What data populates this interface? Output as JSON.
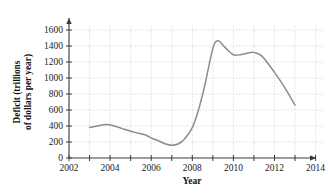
{
  "chart_data": {
    "type": "line",
    "title": "",
    "xlabel": "Year",
    "ylabel": "Deficit (trillions of dollars per year)",
    "ylabel_line1": "Deficit (trillions",
    "ylabel_line2": "of dollars per year)",
    "xlim": [
      2002,
      2014.6
    ],
    "ylim": [
      0,
      1700
    ],
    "grid": true,
    "grid_style": "dotted",
    "legend": "none",
    "line_color": "#8c8c8c",
    "axis_color": "#3a3a3a",
    "grid_color": "#bdbdbd",
    "x_ticks_major": [
      2002,
      2004,
      2006,
      2008,
      2010,
      2012,
      2014
    ],
    "x_ticks_minor": [
      2003,
      2005,
      2007,
      2009,
      2011,
      2013
    ],
    "x_tick_labels": [
      "2002",
      "2004",
      "2006",
      "2008",
      "2010",
      "2012",
      "2014"
    ],
    "y_ticks": [
      0,
      200,
      400,
      600,
      800,
      1000,
      1200,
      1400,
      1600
    ],
    "y_tick_labels": [
      "0",
      "200",
      "400",
      "600",
      "800",
      "1000",
      "1200",
      "1400",
      "1600"
    ],
    "x": [
      2003.0,
      2003.4,
      2003.8,
      2004.2,
      2004.7,
      2005.2,
      2005.7,
      2006.0,
      2006.4,
      2006.7,
      2007.0,
      2007.3,
      2007.6,
      2008.0,
      2008.3,
      2008.6,
      2009.0,
      2009.25,
      2009.6,
      2010.0,
      2010.4,
      2011.0,
      2011.4,
      2012.0,
      2012.5,
      2013.0
    ],
    "y": [
      380,
      400,
      420,
      400,
      360,
      320,
      290,
      250,
      210,
      175,
      160,
      175,
      230,
      380,
      600,
      900,
      1370,
      1465,
      1380,
      1290,
      1295,
      1320,
      1270,
      1070,
      880,
      660
    ],
    "series": [
      {
        "name": "Deficit",
        "points": [
          {
            "year": 2003.0,
            "value": 380
          },
          {
            "year": 2003.8,
            "value": 420
          },
          {
            "year": 2006.0,
            "value": 250
          },
          {
            "year": 2007.0,
            "value": 160
          },
          {
            "year": 2009.25,
            "value": 1465
          },
          {
            "year": 2010.0,
            "value": 1290
          },
          {
            "year": 2011.0,
            "value": 1320
          },
          {
            "year": 2013.0,
            "value": 660
          }
        ]
      }
    ]
  }
}
